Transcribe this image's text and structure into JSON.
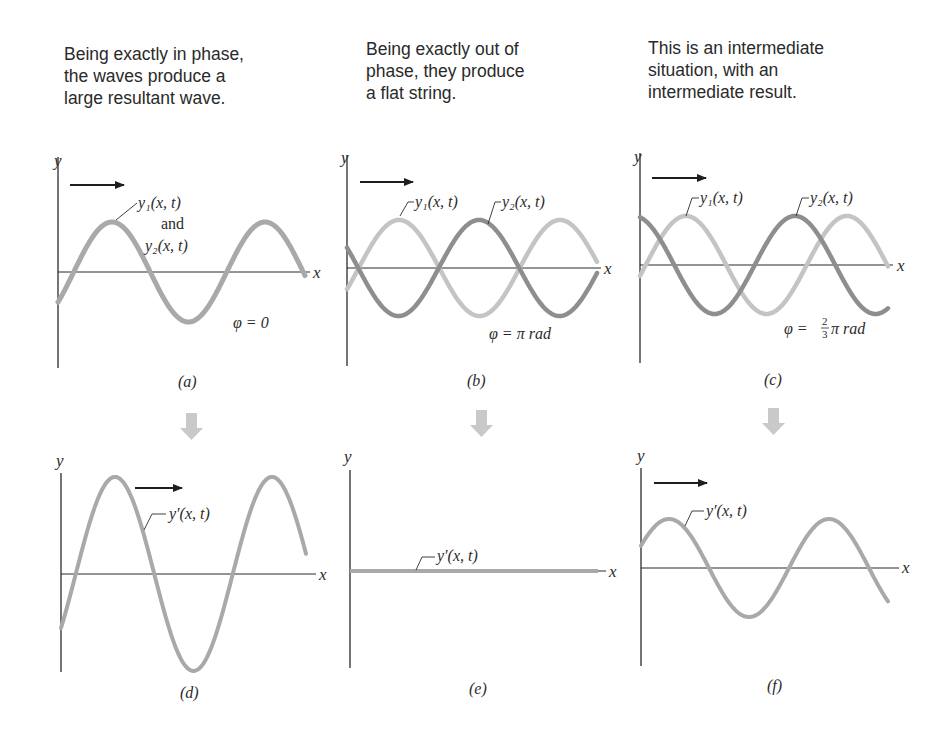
{
  "captions": [
    "Being exactly in phase,\nthe waves produce a\nlarge resultant wave.",
    "Being exactly out of\nphase, they produce\na flat string.",
    "This is an intermediate\nsituation, with an\nintermediate result."
  ],
  "colors": {
    "wave_light": "#c4c4c4",
    "wave_dark": "#8e8e8e",
    "wave_sum": "#a9a9a9",
    "down_arrow": "#c9c9c9",
    "axis": "#2b2b2b",
    "text": "#2a2a2a"
  },
  "axis_labels": {
    "x": "x",
    "y": "y"
  },
  "panels": {
    "a": {
      "label": "(a)",
      "wave_label_1": "y₁(x, t)",
      "wave_label_and": "and",
      "wave_label_2": "y₂(x, t)",
      "phase": "φ = 0"
    },
    "b": {
      "label": "(b)",
      "wave_label_1": "y₁(x, t)",
      "wave_label_2": "y₂(x, t)",
      "phase": "φ = π rad"
    },
    "c": {
      "label": "(c)",
      "wave_label_1": "y₁(x, t)",
      "wave_label_2": "y₂(x, t)",
      "phase_prefix": "φ =",
      "phase_num": "2",
      "phase_den": "3",
      "phase_suffix": "π rad"
    },
    "d": {
      "label": "(d)",
      "wave_label": "y′(x, t)"
    },
    "e": {
      "label": "(e)",
      "wave_label": "y′(x, t)"
    },
    "f": {
      "label": "(f)",
      "wave_label": "y′(x, t)"
    }
  },
  "chart_data": [
    {
      "type": "line",
      "panel": "a",
      "title": "Being exactly in phase, the waves produce a large resultant wave.",
      "xlabel": "x",
      "ylabel": "y",
      "phase_difference_rad": 0,
      "series": [
        {
          "name": "y1(x, t)",
          "amplitude": 1,
          "coincident_with": "y2(x, t)"
        },
        {
          "name": "y2(x, t)",
          "amplitude": 1
        }
      ],
      "annotation": "φ = 0"
    },
    {
      "type": "line",
      "panel": "b",
      "title": "Being exactly out of phase, they produce a flat string.",
      "xlabel": "x",
      "ylabel": "y",
      "phase_difference_rad": 3.1416,
      "series": [
        {
          "name": "y1(x, t)",
          "amplitude": 1
        },
        {
          "name": "y2(x, t)",
          "amplitude": 1
        }
      ],
      "annotation": "φ = π rad"
    },
    {
      "type": "line",
      "panel": "c",
      "title": "This is an intermediate situation, with an intermediate result.",
      "xlabel": "x",
      "ylabel": "y",
      "phase_difference_rad": 2.0944,
      "series": [
        {
          "name": "y1(x, t)",
          "amplitude": 1
        },
        {
          "name": "y2(x, t)",
          "amplitude": 1
        }
      ],
      "annotation": "φ = (2/3)π rad"
    },
    {
      "type": "line",
      "panel": "d",
      "xlabel": "x",
      "ylabel": "y",
      "series": [
        {
          "name": "y'(x, t)",
          "amplitude": 2
        }
      ]
    },
    {
      "type": "line",
      "panel": "e",
      "xlabel": "x",
      "ylabel": "y",
      "series": [
        {
          "name": "y'(x, t)",
          "amplitude": 0
        }
      ]
    },
    {
      "type": "line",
      "panel": "f",
      "xlabel": "x",
      "ylabel": "y",
      "series": [
        {
          "name": "y'(x, t)",
          "amplitude": 1
        }
      ]
    }
  ]
}
